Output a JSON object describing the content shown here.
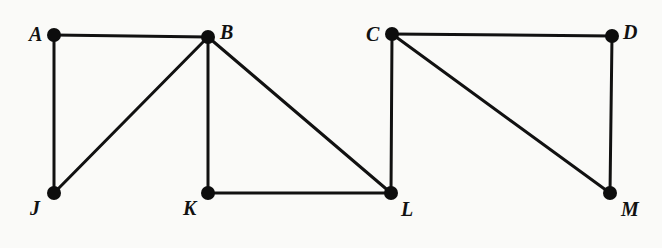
{
  "graph": {
    "nodes": [
      {
        "id": "A",
        "label": "A",
        "x": 54,
        "y": 35,
        "lx": 29,
        "ly": 24
      },
      {
        "id": "B",
        "label": "B",
        "x": 208,
        "y": 37,
        "lx": 220,
        "ly": 22
      },
      {
        "id": "C",
        "label": "C",
        "x": 392,
        "y": 34,
        "lx": 366,
        "ly": 24
      },
      {
        "id": "D",
        "label": "D",
        "x": 612,
        "y": 36,
        "lx": 623,
        "ly": 22
      },
      {
        "id": "J",
        "label": "J",
        "x": 54,
        "y": 193,
        "lx": 30,
        "ly": 198
      },
      {
        "id": "K",
        "label": "K",
        "x": 208,
        "y": 193,
        "lx": 183,
        "ly": 198
      },
      {
        "id": "L",
        "label": "L",
        "x": 391,
        "y": 193,
        "lx": 401,
        "ly": 199
      },
      {
        "id": "M",
        "label": "M",
        "x": 610,
        "y": 193,
        "lx": 621,
        "ly": 199
      }
    ],
    "edges": [
      [
        "A",
        "B"
      ],
      [
        "A",
        "J"
      ],
      [
        "B",
        "J"
      ],
      [
        "B",
        "K"
      ],
      [
        "B",
        "L"
      ],
      [
        "K",
        "L"
      ],
      [
        "C",
        "L"
      ],
      [
        "C",
        "D"
      ],
      [
        "C",
        "M"
      ],
      [
        "D",
        "M"
      ]
    ]
  }
}
